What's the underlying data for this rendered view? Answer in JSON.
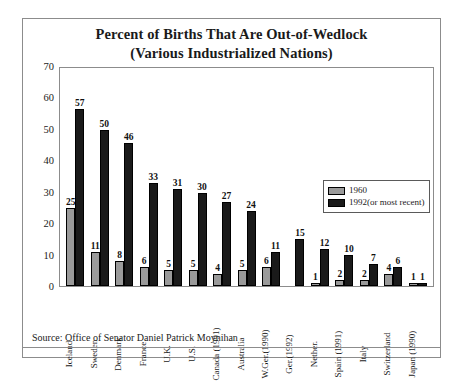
{
  "figure": {
    "title_line1": "Percent of Births That Are Out-of-Wedlock",
    "title_line2": "(Various Industrialized Nations)",
    "source": "Source: Office of Senator Daniel Patrick Moynihan",
    "colors": {
      "series_1960": "#9a9a9a",
      "series_1992": "#1a1a1a",
      "frame": "#8c8c8c",
      "background": "#ffffff"
    }
  },
  "legend": {
    "position": "inside-top-right",
    "entries": [
      {
        "label": "1960",
        "color": "#9a9a9a"
      },
      {
        "label": "1992(or most recent)",
        "color": "#1a1a1a"
      }
    ]
  },
  "chart_data": {
    "type": "bar",
    "title": "Percent of Births That Are Out-of-Wedlock (Various Industrialized Nations)",
    "xlabel": "",
    "ylabel": "",
    "ylim": [
      0,
      70
    ],
    "yticks": [
      0,
      10,
      20,
      30,
      40,
      50,
      60,
      70
    ],
    "grid": false,
    "legend_position": "inside-top-right",
    "categories": [
      "Iceland",
      "Sweden",
      "Denmark",
      "France",
      "U.K.",
      "U.S.",
      "Canada (1991)",
      "Australia",
      "W.Ger.(1990)",
      "Ger.(1992)",
      "Nether.",
      "Spain (1991)",
      "Italy",
      "Switzerland",
      "Japan (1990)"
    ],
    "series": [
      {
        "name": "1960",
        "color": "#9a9a9a",
        "values": [
          25,
          11,
          8,
          6,
          5,
          5,
          4,
          5,
          6,
          null,
          1,
          2,
          2,
          4,
          1
        ]
      },
      {
        "name": "1992(or most recent)",
        "color": "#1a1a1a",
        "values": [
          57,
          50,
          46,
          33,
          31,
          30,
          27,
          24,
          11,
          15,
          12,
          10,
          7,
          6,
          1
        ]
      }
    ]
  }
}
